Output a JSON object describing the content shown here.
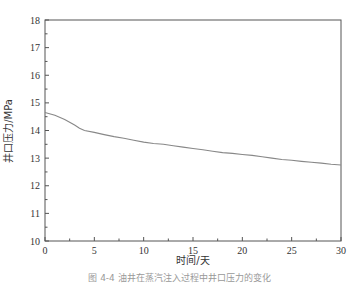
{
  "chart_data": {
    "type": "line",
    "title": "",
    "xlabel": "时间/天",
    "ylabel": "井口压力/MPa",
    "xlim": [
      0,
      30
    ],
    "ylim": [
      10,
      18
    ],
    "xticks": [
      0,
      5,
      10,
      15,
      20,
      25,
      30
    ],
    "yticks": [
      10,
      11,
      12,
      13,
      14,
      15,
      16,
      17,
      18
    ],
    "grid": false,
    "legend": null,
    "series": [
      {
        "name": "井口压力",
        "color": "#888888",
        "x": [
          0,
          1,
          2,
          3,
          3.5,
          4,
          5,
          6,
          7,
          8,
          9,
          10,
          11,
          12,
          13,
          14,
          15,
          16,
          17,
          18,
          19,
          20,
          21,
          22,
          23,
          24,
          25,
          26,
          27,
          28,
          29,
          30
        ],
        "y": [
          14.65,
          14.55,
          14.4,
          14.2,
          14.08,
          14.0,
          13.93,
          13.85,
          13.78,
          13.72,
          13.65,
          13.58,
          13.53,
          13.5,
          13.45,
          13.4,
          13.35,
          13.3,
          13.25,
          13.2,
          13.17,
          13.13,
          13.1,
          13.05,
          13.0,
          12.95,
          12.92,
          12.88,
          12.85,
          12.82,
          12.78,
          12.75
        ]
      }
    ]
  },
  "caption": "图 4-4  油井在蒸汽注入过程中井口压力的变化"
}
